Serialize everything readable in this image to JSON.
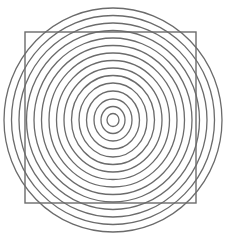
{
  "canvas": {
    "width": 226,
    "height": 239,
    "background_color": "#ffffff"
  },
  "figure": {
    "stroke_color": "#6b6b6b",
    "stroke_width": 1.3
  },
  "chart_data": {
    "type": "scatter",
    "subtitle": "",
    "xlabel": "",
    "ylabel": "",
    "grid": false,
    "legend_position": "none",
    "xlim": [
      0,
      226
    ],
    "ylim": [
      0,
      239
    ],
    "center": {
      "x": 113,
      "y": 120
    },
    "shapes": [
      {
        "name": "square",
        "type": "rect",
        "x": 25,
        "y": 32,
        "width": 171,
        "height": 171,
        "fill": "none",
        "stroke": "#6b6b6b",
        "stroke_width": 1.4
      },
      {
        "name": "circle-15",
        "type": "ellipse",
        "cx": 113,
        "cy": 120,
        "rx": 109,
        "ry": 112,
        "fill": "none",
        "stroke": "#6b6b6b",
        "stroke_width": 1.3
      },
      {
        "name": "circle-14",
        "type": "ellipse",
        "cx": 113,
        "cy": 120,
        "rx": 101.5,
        "ry": 104.5,
        "fill": "none",
        "stroke": "#6b6b6b",
        "stroke_width": 1.3
      },
      {
        "name": "circle-13",
        "type": "ellipse",
        "cx": 113,
        "cy": 120,
        "rx": 94,
        "ry": 97,
        "fill": "none",
        "stroke": "#6b6b6b",
        "stroke_width": 1.3
      },
      {
        "name": "circle-12",
        "type": "ellipse",
        "cx": 113,
        "cy": 120,
        "rx": 86.5,
        "ry": 89.5,
        "fill": "none",
        "stroke": "#6b6b6b",
        "stroke_width": 1.3
      },
      {
        "name": "circle-11",
        "type": "ellipse",
        "cx": 113,
        "cy": 120,
        "rx": 79,
        "ry": 82,
        "fill": "none",
        "stroke": "#6b6b6b",
        "stroke_width": 1.3
      },
      {
        "name": "circle-10",
        "type": "ellipse",
        "cx": 113,
        "cy": 120,
        "rx": 71.5,
        "ry": 74.5,
        "fill": "none",
        "stroke": "#6b6b6b",
        "stroke_width": 1.3
      },
      {
        "name": "circle-9",
        "type": "ellipse",
        "cx": 113,
        "cy": 120,
        "rx": 64,
        "ry": 67,
        "fill": "none",
        "stroke": "#6b6b6b",
        "stroke_width": 1.3
      },
      {
        "name": "circle-8",
        "type": "ellipse",
        "cx": 113,
        "cy": 120,
        "rx": 56.5,
        "ry": 59.5,
        "fill": "none",
        "stroke": "#6b6b6b",
        "stroke_width": 1.3
      },
      {
        "name": "circle-7",
        "type": "ellipse",
        "cx": 113,
        "cy": 120,
        "rx": 49,
        "ry": 52,
        "fill": "none",
        "stroke": "#6b6b6b",
        "stroke_width": 1.3
      },
      {
        "name": "circle-6",
        "type": "ellipse",
        "cx": 113,
        "cy": 120,
        "rx": 41.5,
        "ry": 44.5,
        "fill": "none",
        "stroke": "#6b6b6b",
        "stroke_width": 1.3
      },
      {
        "name": "circle-5",
        "type": "ellipse",
        "cx": 113,
        "cy": 120,
        "rx": 34,
        "ry": 37,
        "fill": "none",
        "stroke": "#6b6b6b",
        "stroke_width": 1.3
      },
      {
        "name": "circle-4",
        "type": "ellipse",
        "cx": 113,
        "cy": 120,
        "rx": 26.5,
        "ry": 29,
        "fill": "none",
        "stroke": "#6b6b6b",
        "stroke_width": 1.3
      },
      {
        "name": "circle-3",
        "type": "ellipse",
        "cx": 113,
        "cy": 120,
        "rx": 19,
        "ry": 21,
        "fill": "none",
        "stroke": "#6b6b6b",
        "stroke_width": 1.3
      },
      {
        "name": "circle-2",
        "type": "ellipse",
        "cx": 113,
        "cy": 120,
        "rx": 12,
        "ry": 13.5,
        "fill": "none",
        "stroke": "#6b6b6b",
        "stroke_width": 1.3
      },
      {
        "name": "circle-1",
        "type": "ellipse",
        "cx": 113,
        "cy": 120,
        "rx": 6,
        "ry": 6.5,
        "fill": "none",
        "stroke": "#6b6b6b",
        "stroke_width": 1.3
      }
    ],
    "ring_count": 15,
    "ring_spacing_px": 7.5,
    "inner_radius_px": 6,
    "outer_radius_px": 109
  }
}
